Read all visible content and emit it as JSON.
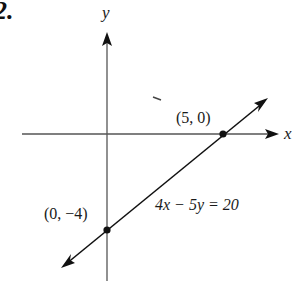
{
  "figure": {
    "problem_number": "2.",
    "axes": {
      "x_label": "x",
      "y_label": "y"
    },
    "line": {
      "equation": "4x − 5y = 20",
      "slope": 0.8,
      "y_intercept": -4
    },
    "points": [
      {
        "label": "(5, 0)",
        "x": 5,
        "y": 0
      },
      {
        "label": "(0, −4)",
        "x": 0,
        "y": -4
      }
    ],
    "colors": {
      "ink": "#1a1a1a",
      "axis": "#555555",
      "background": "#ffffff"
    }
  }
}
